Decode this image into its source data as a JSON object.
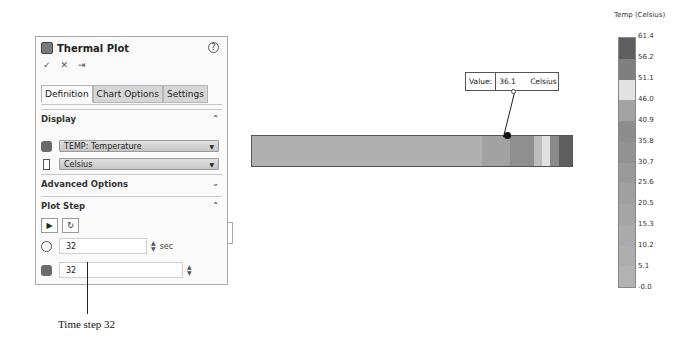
{
  "panel": {
    "title": "Thermal Plot",
    "help": "?",
    "actions": [
      "✓",
      "✕",
      "⇥"
    ],
    "tabs": [
      {
        "label": "Definition",
        "active": true
      },
      {
        "label": "Chart Options",
        "active": false
      },
      {
        "label": "Settings",
        "active": false
      }
    ],
    "display": {
      "header": "Display",
      "quantity": "TEMP: Temperature",
      "units": "Celsius"
    },
    "advanced": {
      "header": "Advanced Options"
    },
    "plot_step": {
      "header": "Plot Step",
      "time_value": "32",
      "time_unit": "sec",
      "step_value": "32"
    }
  },
  "annotation": {
    "caption": "Time step 32"
  },
  "probe": {
    "label": "Value:",
    "value": "36.1",
    "unit": "Celsius"
  },
  "legend": {
    "title": "Temp (Celsius)",
    "ticks": [
      "61.4",
      "56.2",
      "51.1",
      "46.0",
      "40.9",
      "35.8",
      "30.7",
      "25.6",
      "20.5",
      "15.3",
      "10.2",
      "5.1",
      "-0.0"
    ],
    "colors": [
      "#5e5e5e",
      "#7f7f7f",
      "#e2e2e2",
      "#a3a3a3",
      "#8d8d8d",
      "#929292",
      "#9a9a9a",
      "#a0a0a0",
      "#a5a5a5",
      "#aaaaaa",
      "#aeaeae",
      "#b2b2b2"
    ]
  },
  "bar": {
    "segments": [
      {
        "w": 230,
        "color": "#b0b0b0"
      },
      {
        "w": 28,
        "color": "#a2a2a2"
      },
      {
        "w": 24,
        "color": "#8f8f8f"
      },
      {
        "w": 8,
        "color": "#bdbdbd"
      },
      {
        "w": 8,
        "color": "#e0e0e0"
      },
      {
        "w": 9,
        "color": "#8a8a8a"
      },
      {
        "w": 13,
        "color": "#5e5e5e"
      }
    ]
  }
}
